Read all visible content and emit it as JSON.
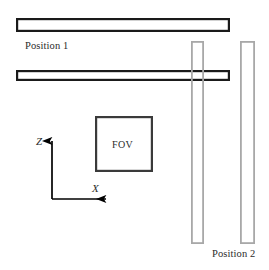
{
  "figure": {
    "background_color": "#ffffff",
    "width": 269,
    "height": 270
  },
  "labels": {
    "position_1": "Position 1",
    "position_2": "Position 2",
    "fov": "FOV",
    "axis_z": "Z",
    "axis_x": "X"
  },
  "colors": {
    "slab_outline_dark": "#1a1a1a",
    "slab_outline_gray": "#a8a8a8",
    "fov_outline": "#3a3a3a",
    "axis_color": "#000000",
    "text_color": "#2b2b2b",
    "fill": "#ffffff"
  },
  "shapes": {
    "horizontal_slabs": [
      {
        "name": "slab-horizontal-top",
        "x": 16,
        "y": 18,
        "width": 214,
        "height": 14,
        "stroke": "#1a1a1a",
        "stroke_width": 2.2
      },
      {
        "name": "slab-horizontal-bottom",
        "x": 16,
        "y": 70,
        "width": 214,
        "height": 11,
        "stroke": "#1a1a1a",
        "stroke_width": 2.2
      }
    ],
    "vertical_slabs": [
      {
        "name": "slab-vertical-inner",
        "x": 191,
        "y": 41,
        "width": 13,
        "height": 203,
        "stroke": "#a8a8a8",
        "stroke_width": 1.8
      },
      {
        "name": "slab-vertical-outer",
        "x": 240,
        "y": 41,
        "width": 15,
        "height": 203,
        "stroke": "#a8a8a8",
        "stroke_width": 1.8
      }
    ],
    "fov_box": {
      "name": "fov-box",
      "x": 95,
      "y": 116,
      "width": 58,
      "height": 56,
      "stroke": "#3a3a3a",
      "stroke_width": 2.2
    },
    "axes": {
      "origin": {
        "x": 52,
        "y": 199
      },
      "z_axis_tip": {
        "x": 52,
        "y": 136
      },
      "x_axis_tip": {
        "x": 111,
        "y": 199
      },
      "stroke_width": 1.6
    }
  }
}
